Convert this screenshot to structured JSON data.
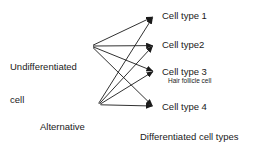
{
  "diagram": {
    "stroke_color": "#1a1a1a",
    "background_color": "#ffffff",
    "sources": [
      {
        "id": "undifferentiated-cell",
        "line1": "Undifferentiated",
        "line2": "cell",
        "hub_x": 91,
        "hub_y": 46
      },
      {
        "id": "alternative-pathways",
        "line1": "Alternative",
        "line2": "determination",
        "line3": "pathways",
        "hub_x": 97,
        "hub_y": 105
      }
    ],
    "targets": [
      {
        "id": "cell-type-1",
        "label": "Cell type 1",
        "sublabel": "",
        "arrow_x": 157,
        "arrow_y": 16
      },
      {
        "id": "cell-type-2",
        "label": "Cell type2",
        "sublabel": "",
        "arrow_x": 157,
        "arrow_y": 45
      },
      {
        "id": "cell-type-3",
        "label": "Cell type 3",
        "sublabel": "Hair follicle cell",
        "arrow_x": 157,
        "arrow_y": 72
      },
      {
        "id": "cell-type-4",
        "label": "Cell type 4",
        "sublabel": "",
        "arrow_x": 157,
        "arrow_y": 107
      }
    ],
    "footer": "Differentiated cell types"
  }
}
